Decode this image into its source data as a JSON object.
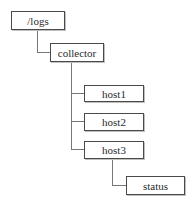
{
  "tree": {
    "root": {
      "label": "/logs"
    },
    "level1": {
      "label": "collector"
    },
    "hosts": [
      {
        "label": "host1"
      },
      {
        "label": "host2"
      },
      {
        "label": "host3"
      }
    ],
    "host3_child": {
      "label": "status"
    }
  },
  "colors": {
    "border": "#4a4a4a",
    "connector": "#777777",
    "text": "#2a2a2a",
    "background": "#ffffff"
  }
}
